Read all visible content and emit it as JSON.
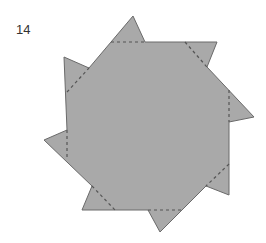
{
  "figure": {
    "number_label": "14",
    "fill_color": "#a9a9a9",
    "edge_color": "#6a6a6a",
    "fold_line_color": "#555555"
  }
}
